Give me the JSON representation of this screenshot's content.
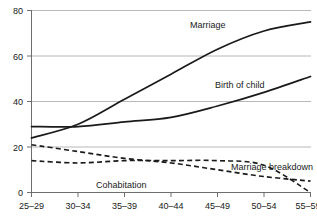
{
  "chart_data": {
    "type": "line",
    "title": "",
    "subtitle": "",
    "xlabel": "",
    "ylabel": "",
    "categories": [
      "25–29",
      "30–34",
      "35–39",
      "40–44",
      "45–49",
      "50–54",
      "55–59"
    ],
    "ylim": [
      0,
      80
    ],
    "yticks": [
      0,
      20,
      40,
      60,
      80
    ],
    "grid": true,
    "legend_position": "inline-annotations",
    "series": [
      {
        "name": "Marriage",
        "style": "solid",
        "color": "#1a1a1a",
        "values": [
          24,
          30,
          41,
          52,
          63,
          71,
          75
        ]
      },
      {
        "name": "Birth of child",
        "style": "solid",
        "color": "#1a1a1a",
        "values": [
          29,
          29,
          31,
          33,
          38,
          44,
          51
        ]
      },
      {
        "name": "Marriage breakdown",
        "style": "dashed",
        "color": "#1a1a1a",
        "values": [
          21,
          18,
          15,
          13,
          10,
          7,
          5
        ]
      },
      {
        "name": "Cohabitation",
        "style": "dashed",
        "color": "#1a1a1a",
        "values": [
          14,
          13,
          14,
          14,
          14,
          12,
          0
        ]
      }
    ],
    "annotations": [
      {
        "text": "Marriage",
        "x_pixel": 190,
        "y_pixel": 28
      },
      {
        "text": "Birth of child",
        "x_pixel": 215,
        "y_pixel": 88
      },
      {
        "text": "Marriage breakdown",
        "x_pixel": 231,
        "y_pixel": 170
      },
      {
        "text": "Cohabitation",
        "x_pixel": 96,
        "y_pixel": 188
      }
    ]
  },
  "axes": {
    "ytick_labels": [
      "80",
      "60",
      "40",
      "20",
      "0"
    ],
    "xtick_labels": [
      "25–29",
      "30–34",
      "35–39",
      "40–44",
      "45–49",
      "50–54",
      "55–59"
    ]
  },
  "labels": {
    "marriage": "Marriage",
    "birth_of_child": "Birth of child",
    "marriage_breakdown": "Marriage breakdown",
    "cohabitation": "Cohabitation"
  },
  "colors": {
    "line": "#1a1a1a",
    "grid": "#b8b8b8",
    "axis": "#6e6e6e",
    "background": "#ffffff"
  }
}
